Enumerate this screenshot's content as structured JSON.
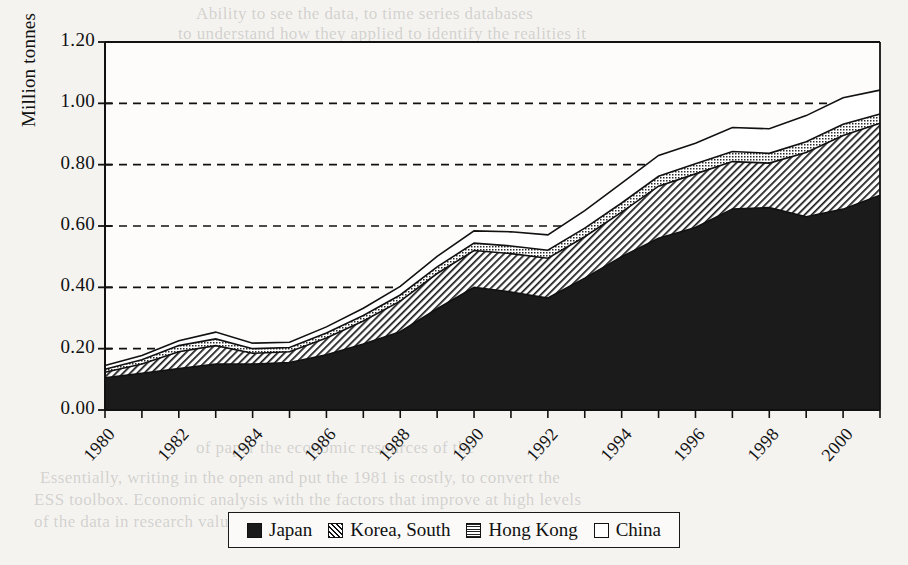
{
  "figure": {
    "ylabel": "Million tonnes",
    "plot": {
      "left": 105,
      "right": 880,
      "top": 42,
      "bottom": 410
    }
  },
  "bleed_text": [
    {
      "text": "Ability to see the data, to time series databases",
      "x": 196,
      "y": 4
    },
    {
      "text": "to understand how they applied to identify the realities it",
      "x": 178,
      "y": 24
    },
    {
      "text": "in the case that they desired into context, it is useful",
      "x": 172,
      "y": 48
    },
    {
      "text": "perspectives and a complete understanding",
      "x": 246,
      "y": 72
    },
    {
      "text": "the present of the estimated data",
      "x": 300,
      "y": 116
    },
    {
      "text": "patterns and industry supply",
      "x": 322,
      "y": 158
    },
    {
      "text": "The figures are, specifically, from and detail",
      "x": 258,
      "y": 288
    },
    {
      "text": "data the other series",
      "x": 352,
      "y": 312
    },
    {
      "text": "of paper the economic resources of the",
      "x": 196,
      "y": 438
    },
    {
      "text": "Essentially, writing in the open and put the 1981 is costly, to convert the",
      "x": 40,
      "y": 468
    },
    {
      "text": "ESS toolbox. Economic analysis with the factors that improve at high levels",
      "x": 34,
      "y": 490
    },
    {
      "text": "of the data in research values when the products in the",
      "x": 34,
      "y": 512
    }
  ],
  "legend": {
    "items": [
      {
        "label": "Japan",
        "pattern": "solid-black",
        "swatch_class": "sw-japan"
      },
      {
        "label": "Korea, South",
        "pattern": "diagonal-hatch",
        "swatch_class": "sw-korea"
      },
      {
        "label": "Hong Kong",
        "pattern": "cross-dot-hatch",
        "swatch_class": "sw-hk"
      },
      {
        "label": "China",
        "pattern": "white-empty",
        "swatch_class": "sw-china"
      }
    ]
  },
  "chart_data": {
    "type": "area",
    "stacked": true,
    "title": "",
    "xlabel": "",
    "ylabel": "Million tonnes",
    "xlim": [
      1980,
      2001
    ],
    "ylim": [
      0.0,
      1.2
    ],
    "ytick_values": [
      0.0,
      0.2,
      0.4,
      0.6,
      0.8,
      1.0,
      1.2
    ],
    "ytick_labels": [
      "0.00",
      "0.20",
      "0.40",
      "0.60",
      "0.80",
      "1.00",
      "1.20"
    ],
    "xtick_values": [
      1980,
      1981,
      1982,
      1983,
      1984,
      1985,
      1986,
      1987,
      1988,
      1989,
      1990,
      1991,
      1992,
      1993,
      1994,
      1995,
      1996,
      1997,
      1998,
      1999,
      2000,
      2001
    ],
    "xtick_labels_shown": [
      "1980",
      "1982",
      "1984",
      "1986",
      "1988",
      "1990",
      "1992",
      "1994",
      "1996",
      "1998",
      "2000"
    ],
    "xtick_label_step": 2,
    "grid": "horizontal-dashed",
    "legend_position": "bottom",
    "x": [
      1980,
      1981,
      1982,
      1983,
      1984,
      1985,
      1986,
      1987,
      1988,
      1989,
      1990,
      1991,
      1992,
      1993,
      1994,
      1995,
      1996,
      1997,
      1998,
      1999,
      2000,
      2001
    ],
    "series": [
      {
        "name": "Japan",
        "pattern": "solid-black",
        "values": [
          0.105,
          0.12,
          0.135,
          0.15,
          0.15,
          0.155,
          0.18,
          0.215,
          0.255,
          0.33,
          0.4,
          0.385,
          0.365,
          0.43,
          0.5,
          0.56,
          0.595,
          0.655,
          0.66,
          0.63,
          0.655,
          0.7
        ]
      },
      {
        "name": "Korea, South",
        "pattern": "diagonal-hatch",
        "values": [
          0.018,
          0.03,
          0.055,
          0.06,
          0.035,
          0.035,
          0.055,
          0.075,
          0.1,
          0.115,
          0.12,
          0.125,
          0.13,
          0.135,
          0.145,
          0.17,
          0.175,
          0.155,
          0.145,
          0.21,
          0.24,
          0.235
        ]
      },
      {
        "name": "Hong Kong",
        "pattern": "cross-dot-hatch",
        "values": [
          0.01,
          0.014,
          0.02,
          0.022,
          0.015,
          0.014,
          0.016,
          0.018,
          0.02,
          0.022,
          0.024,
          0.025,
          0.026,
          0.028,
          0.03,
          0.032,
          0.033,
          0.033,
          0.032,
          0.035,
          0.037,
          0.03
        ]
      },
      {
        "name": "China",
        "pattern": "white-empty",
        "values": [
          0.012,
          0.014,
          0.016,
          0.022,
          0.018,
          0.017,
          0.02,
          0.024,
          0.028,
          0.034,
          0.04,
          0.046,
          0.05,
          0.057,
          0.065,
          0.068,
          0.067,
          0.078,
          0.08,
          0.085,
          0.086,
          0.078
        ]
      }
    ],
    "totals": [
      0.145,
      0.178,
      0.226,
      0.254,
      0.218,
      0.221,
      0.271,
      0.332,
      0.403,
      0.501,
      0.584,
      0.581,
      0.571,
      0.65,
      0.74,
      0.83,
      0.87,
      0.921,
      0.917,
      0.96,
      1.018,
      1.043
    ]
  }
}
